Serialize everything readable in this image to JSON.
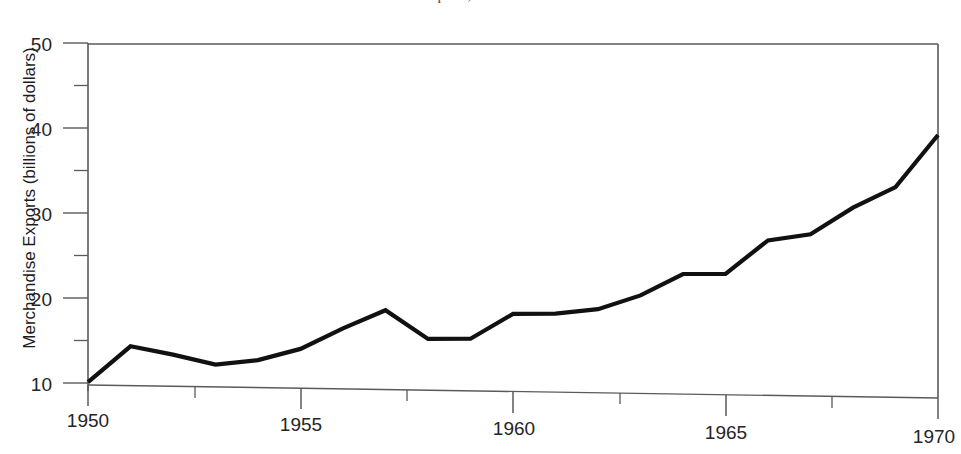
{
  "figure": {
    "title_partial": "Exports, 1950-1970",
    "background_color": "#ffffff",
    "line_color": "#111111",
    "axis_color": "#555555"
  },
  "axes": {
    "ylabel": "Merchandise Exports (billions of dollars)",
    "xlabel": "",
    "y_ticks": [
      "10",
      "20",
      "30",
      "40",
      "50"
    ],
    "y_minor_ticks": [
      "15",
      "25",
      "35",
      "45"
    ],
    "x_ticks": [
      "1950",
      "1955",
      "1960",
      "1965",
      "1970"
    ],
    "x_minor_ticks": [
      "1952.5",
      "1957.5",
      "1962.5",
      "1967.5"
    ]
  },
  "chart_data": {
    "type": "line",
    "title": "Exports, 1950-1970",
    "xlabel": "",
    "ylabel": "Merchandise Exports (billions of dollars)",
    "xlim": [
      1950,
      1970
    ],
    "ylim": [
      10,
      50
    ],
    "grid": false,
    "legend": null,
    "x": [
      1950,
      1951,
      1952,
      1953,
      1954,
      1955,
      1956,
      1957,
      1958,
      1959,
      1960,
      1961,
      1962,
      1963,
      1964,
      1965,
      1966,
      1967,
      1968,
      1969,
      1970
    ],
    "values": [
      10.1,
      14.4,
      13.5,
      12.4,
      13.0,
      14.4,
      16.9,
      19.1,
      15.8,
      15.9,
      18.9,
      19.0,
      19.6,
      21.3,
      23.9,
      24.0,
      28.0,
      28.8,
      32.0,
      34.5,
      40.7
    ]
  }
}
